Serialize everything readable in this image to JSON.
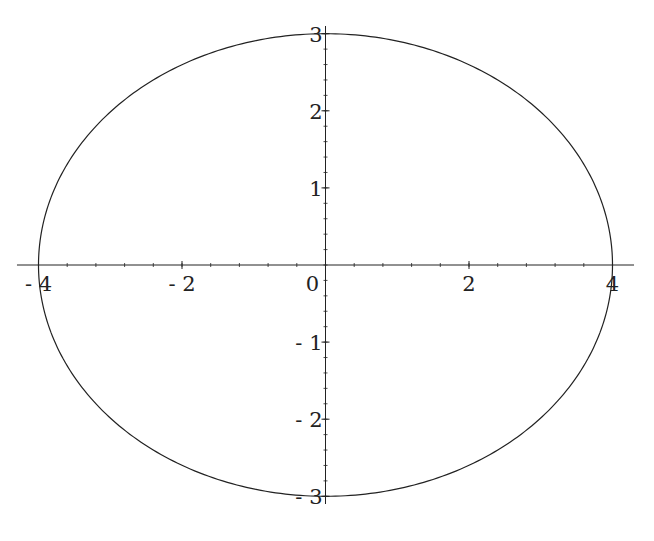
{
  "chart_data": {
    "type": "line",
    "title": "",
    "xlabel": "",
    "ylabel": "",
    "equation": "x^2/16 + y^2/9 = 1",
    "semi_axis_x": 4,
    "semi_axis_y": 3,
    "xlim": [
      -4.3,
      4.3
    ],
    "ylim": [
      -3.1,
      3.1
    ],
    "grid": false,
    "legend": null,
    "x_ticks": [
      -4,
      -2,
      0,
      2,
      4
    ],
    "x_tick_labels": [
      "-4",
      "-2",
      "0",
      "2",
      "4"
    ],
    "y_ticks": [
      -3,
      -2,
      -1,
      1,
      2,
      3
    ],
    "y_tick_labels": [
      "-3",
      "-2",
      "-1",
      "1",
      "2",
      "3"
    ],
    "minor_tick_step_x": 0.4,
    "minor_tick_step_y": 0.2,
    "series": [
      {
        "name": "ellipse",
        "color": "#222222",
        "points": [
          {
            "x": 4,
            "y": 0
          },
          {
            "x": 3.464,
            "y": 1.5
          },
          {
            "x": 2,
            "y": 2.598
          },
          {
            "x": 0,
            "y": 3
          },
          {
            "x": -2,
            "y": 2.598
          },
          {
            "x": -3.464,
            "y": 1.5
          },
          {
            "x": -4,
            "y": 0
          },
          {
            "x": -3.464,
            "y": -1.5
          },
          {
            "x": -2,
            "y": -2.598
          },
          {
            "x": 0,
            "y": -3
          },
          {
            "x": 2,
            "y": -2.598
          },
          {
            "x": 3.464,
            "y": -1.5
          },
          {
            "x": 4,
            "y": 0
          }
        ]
      }
    ]
  },
  "layout": {
    "origin_px": [
      325.5,
      265
    ],
    "x_px_per_unit": 71.75,
    "y_px_per_unit": 77.1,
    "axis_color": "#222222"
  }
}
